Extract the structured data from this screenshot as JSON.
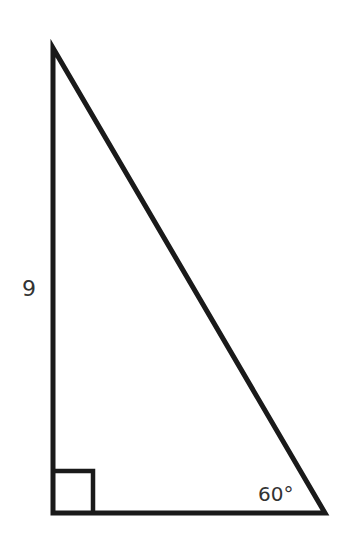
{
  "figure": {
    "type": "right-triangle",
    "vertices": {
      "top": [
        53,
        48
      ],
      "right_angle": [
        53,
        513
      ],
      "bottom_right": [
        325,
        513
      ]
    },
    "right_angle_marker_size": 40,
    "stroke_color": "#1a1a1a",
    "labels": {
      "vertical_leg": "9",
      "angle": "60°"
    }
  }
}
